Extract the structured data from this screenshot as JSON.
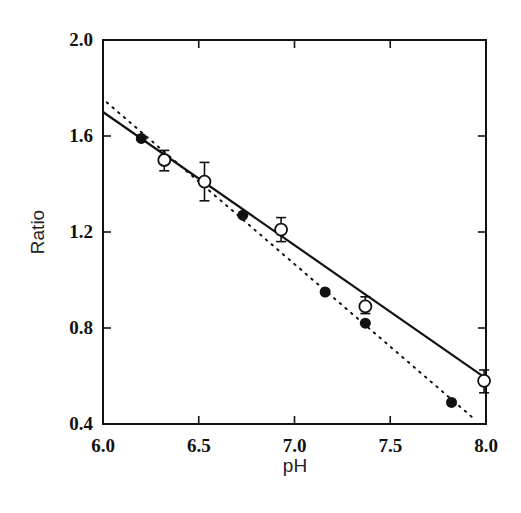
{
  "chart_data": {
    "type": "scatter",
    "title": "",
    "xlabel": "pH",
    "ylabel": "Ratio",
    "xlim": [
      6.0,
      8.0
    ],
    "ylim": [
      0.4,
      2.0
    ],
    "xticks": [
      "6.0",
      "6.5",
      "7.0",
      "7.5",
      "8.0"
    ],
    "yticks": [
      "0.4",
      "0.8",
      "1.2",
      "1.6",
      "2.0"
    ],
    "grid": false,
    "legend": null,
    "series": [
      {
        "name": "filled circles",
        "marker": "filled-circle",
        "points": [
          {
            "x": 6.2,
            "y": 1.59
          },
          {
            "x": 6.73,
            "y": 1.27
          },
          {
            "x": 7.16,
            "y": 0.95
          },
          {
            "x": 7.37,
            "y": 0.82
          },
          {
            "x": 7.82,
            "y": 0.49
          }
        ],
        "fit": {
          "style": "dotted",
          "x": [
            6.02,
            7.94
          ],
          "y": [
            1.74,
            0.42
          ]
        }
      },
      {
        "name": "open circles",
        "marker": "open-circle",
        "points": [
          {
            "x": 6.32,
            "y": 1.5,
            "err_low": 1.455,
            "err_high": 1.54
          },
          {
            "x": 6.53,
            "y": 1.41,
            "err_low": 1.33,
            "err_high": 1.49
          },
          {
            "x": 6.93,
            "y": 1.21,
            "err_low": 1.16,
            "err_high": 1.26
          },
          {
            "x": 7.37,
            "y": 0.89,
            "err_low": 0.86,
            "err_high": 0.93
          },
          {
            "x": 7.99,
            "y": 0.58,
            "err_low": 0.53,
            "err_high": 0.625
          }
        ],
        "fit": {
          "style": "solid",
          "x": [
            6.0,
            8.0
          ],
          "y": [
            1.7,
            0.59
          ]
        }
      }
    ]
  },
  "colors": {
    "ink": "#111111",
    "background": "#ffffff"
  }
}
